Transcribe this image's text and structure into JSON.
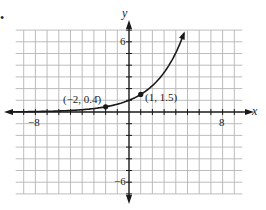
{
  "problem_marker": "•",
  "chart_data": {
    "type": "line",
    "title": "",
    "function": "y = 1.5^x",
    "xlabel": "x",
    "ylabel": "y",
    "xlim": [
      -9,
      9
    ],
    "ylim": [
      -7,
      7
    ],
    "grid": true,
    "tick_labels": {
      "x": [
        {
          "value": -8,
          "label": "-8"
        },
        {
          "value": 8,
          "label": "8"
        }
      ],
      "y": [
        {
          "value": 6,
          "label": "6"
        },
        {
          "value": -6,
          "label": "-6"
        }
      ]
    },
    "series": [
      {
        "name": "exponential curve",
        "x": [
          -9,
          -8,
          -7,
          -6,
          -5,
          -4,
          -3,
          -2,
          -1,
          0,
          1,
          2,
          3,
          4,
          4.76
        ],
        "y": [
          0.026,
          0.039,
          0.059,
          0.088,
          0.132,
          0.198,
          0.296,
          0.444,
          0.667,
          1,
          1.5,
          2.25,
          3.375,
          5.0625,
          6.9
        ],
        "left_arrow": true,
        "right_arrow": true
      }
    ],
    "annotations": [
      {
        "x": -2,
        "y": 0.444,
        "label": "(−2, 0.4̄)"
      },
      {
        "x": 1,
        "y": 1.5,
        "label": "(1, 1.5)"
      }
    ],
    "colors": {
      "grid": "#b5b5b5",
      "axis": "#1a1a1a",
      "curve": "#1a1a1a"
    }
  },
  "labels": {
    "x_axis": "x",
    "y_axis": "y",
    "x_neg": "−8",
    "x_pos": "8",
    "y_pos": "6",
    "y_neg": "−6",
    "point1": "(−2, 0.4̄)",
    "point2": "(1, 1.5)"
  }
}
